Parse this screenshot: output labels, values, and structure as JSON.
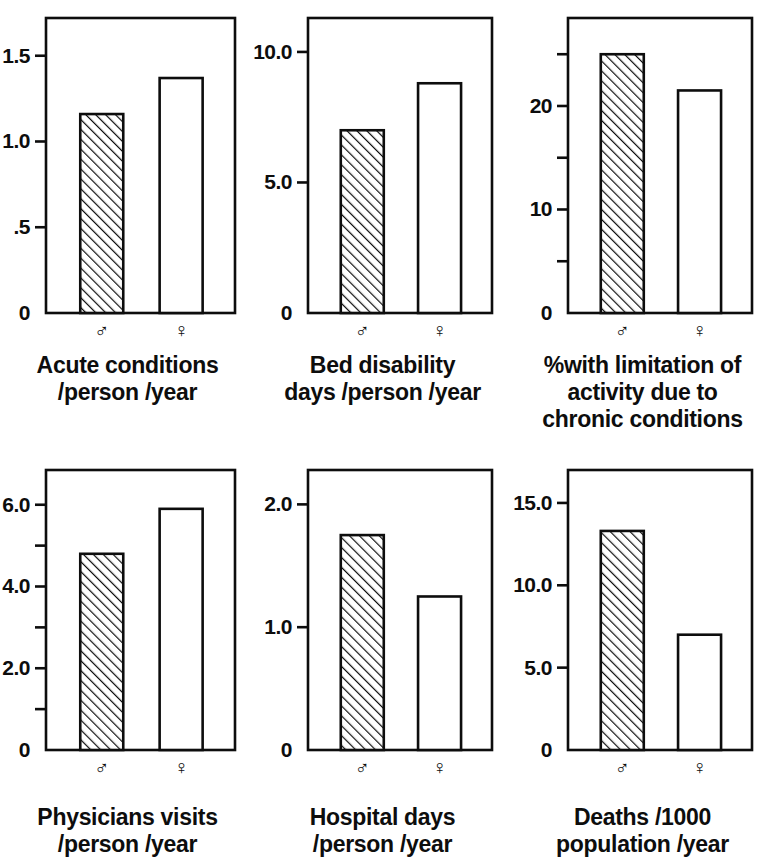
{
  "figure": {
    "background_color": "#ffffff",
    "ink_color": "#0d0d0d",
    "male_symbol": "♂",
    "female_symbol": "♀",
    "male_fill": "hatched-45deg",
    "female_fill": "none"
  },
  "chart_data": [
    {
      "type": "bar",
      "title": "",
      "caption_lines": [
        "Acute conditions",
        "/person /year"
      ],
      "categories": [
        "♂",
        "♀"
      ],
      "series": [
        {
          "name": "Acute conditions per person per year",
          "values": [
            1.16,
            1.37
          ]
        }
      ],
      "values": [
        1.16,
        1.37
      ],
      "xlabel": "",
      "ylabel": "",
      "ylim": [
        0,
        1.72
      ],
      "yticks": [
        0,
        0.5,
        1.0,
        1.5
      ],
      "ytick_labels": [
        "0",
        ".5",
        "1.0",
        "1.5"
      ],
      "grid": false,
      "legend": "none"
    },
    {
      "type": "bar",
      "title": "",
      "caption_lines": [
        "Bed disability",
        "days /person /year"
      ],
      "categories": [
        "♂",
        "♀"
      ],
      "series": [
        {
          "name": "Bed disability days per person per year",
          "values": [
            7.0,
            8.8
          ]
        }
      ],
      "values": [
        7.0,
        8.8
      ],
      "xlabel": "",
      "ylabel": "",
      "ylim": [
        0,
        11.3
      ],
      "yticks": [
        0,
        5.0,
        10.0
      ],
      "ytick_labels": [
        "0",
        "5.0",
        "10.0"
      ],
      "grid": false,
      "legend": "none"
    },
    {
      "type": "bar",
      "title": "",
      "caption_lines": [
        "%with limitation of",
        "activity due to",
        "chronic conditions"
      ],
      "categories": [
        "♂",
        "♀"
      ],
      "series": [
        {
          "name": "% with limitation of activity due to chronic conditions",
          "values": [
            25.0,
            21.5
          ]
        }
      ],
      "values": [
        25.0,
        21.5
      ],
      "xlabel": "",
      "ylabel": "",
      "ylim": [
        0,
        28.5
      ],
      "yticks": [
        0,
        5,
        10,
        15,
        20,
        25
      ],
      "ytick_labels": [
        "0",
        "",
        "10",
        "",
        "20",
        ""
      ],
      "grid": false,
      "legend": "none"
    },
    {
      "type": "bar",
      "title": "",
      "caption_lines": [
        "Physicians visits",
        "/person /year"
      ],
      "categories": [
        "♂",
        "♀"
      ],
      "series": [
        {
          "name": "Physicians visits per person per year",
          "values": [
            4.8,
            5.9
          ]
        }
      ],
      "values": [
        4.8,
        5.9
      ],
      "xlabel": "",
      "ylabel": "",
      "ylim": [
        0,
        6.85
      ],
      "yticks": [
        0,
        1,
        2,
        3,
        4,
        5,
        6
      ],
      "ytick_labels": [
        "0",
        "",
        "2.0",
        "",
        "4.0",
        "",
        "6.0"
      ],
      "grid": false,
      "legend": "none"
    },
    {
      "type": "bar",
      "title": "",
      "caption_lines": [
        "Hospital days",
        "/person /year"
      ],
      "categories": [
        "♂",
        "♀"
      ],
      "series": [
        {
          "name": "Hospital days per person per year",
          "values": [
            1.75,
            1.25
          ]
        }
      ],
      "values": [
        1.75,
        1.25
      ],
      "xlabel": "",
      "ylabel": "",
      "ylim": [
        0,
        2.28
      ],
      "yticks": [
        0,
        1.0,
        2.0
      ],
      "ytick_labels": [
        "0",
        "1.0",
        "2.0"
      ],
      "grid": false,
      "legend": "none"
    },
    {
      "type": "bar",
      "title": "",
      "caption_lines": [
        "Deaths /1000",
        "population /year"
      ],
      "categories": [
        "♂",
        "♀"
      ],
      "series": [
        {
          "name": "Deaths per 1000 population per year",
          "values": [
            13.3,
            7.0
          ]
        }
      ],
      "values": [
        13.3,
        7.0
      ],
      "xlabel": "",
      "ylabel": "",
      "ylim": [
        0,
        17.0
      ],
      "yticks": [
        0,
        5.0,
        10.0,
        15.0
      ],
      "ytick_labels": [
        "0",
        "5.0",
        "10.0",
        "15.0"
      ],
      "grid": false,
      "legend": "none"
    }
  ]
}
